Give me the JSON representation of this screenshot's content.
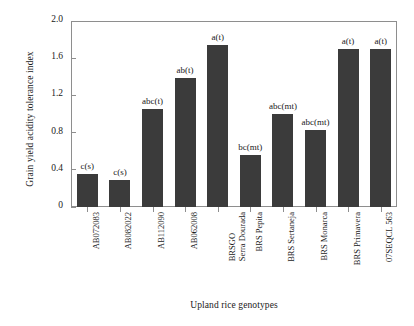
{
  "chart_data": {
    "type": "bar",
    "title": "",
    "xlabel": "Upland rice genotypes",
    "ylabel": "Grain yield acidity tolerance index",
    "ylim": [
      0,
      2.0
    ],
    "yticks": [
      "0",
      "0.4",
      "0.8",
      "1.2",
      "1.6",
      "2.0"
    ],
    "ytick_values": [
      0,
      0.4,
      0.8,
      1.2,
      1.6,
      2.0
    ],
    "grid": false,
    "legend": "none",
    "bar_color": "#3b3b3b",
    "categories": [
      "AB072083",
      "AB082022",
      "AB112090",
      "AB062008",
      "BRSGO Serra Dourada",
      "BRS Pepita",
      "BRS Sertaneja",
      "BRS Monarca",
      "BRS Primavera",
      "07SEQCL 563"
    ],
    "category_lines": [
      [
        "AB072083"
      ],
      [
        "AB082022"
      ],
      [
        "AB112090"
      ],
      [
        "AB062008"
      ],
      [
        "BRSGO",
        "Serra Dourada"
      ],
      [
        "BRS Pepita"
      ],
      [
        "BRS Sertaneja"
      ],
      [
        "BRS Monarca"
      ],
      [
        "BRS Primavera"
      ],
      [
        "07SEQCL 563"
      ]
    ],
    "values": [
      0.36,
      0.29,
      1.05,
      1.39,
      1.74,
      0.56,
      1.0,
      0.83,
      1.7,
      1.7
    ],
    "annotations": [
      "c(s)",
      "c(s)",
      "abc(t)",
      "ab(t)",
      "a(t)",
      "bc(mt)",
      "abc(mt)",
      "abc(mt)",
      "a(t)",
      "a(t)"
    ]
  }
}
